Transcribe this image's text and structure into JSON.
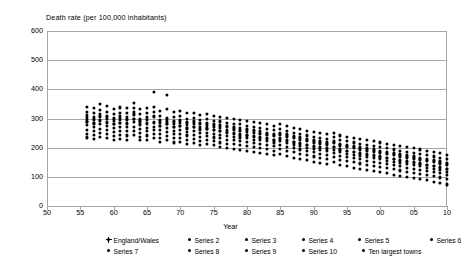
{
  "chart_data": {
    "type": "scatter",
    "title": "",
    "ylabel": "Death rate (per 100,000 inhabitants)",
    "xlabel": "Year",
    "ylim": [
      0,
      600
    ],
    "xlim": [
      50,
      110
    ],
    "grid": true,
    "legend_position": "bottom",
    "y_ticks": [
      "0",
      "100",
      "200",
      "300",
      "400",
      "500",
      "600"
    ],
    "y_tick_values": [
      0,
      100,
      200,
      300,
      400,
      500,
      600
    ],
    "x_ticks": [
      "50",
      "55",
      "60",
      "65",
      "70",
      "75",
      "80",
      "85",
      "90",
      "95",
      "00",
      "05",
      "10"
    ],
    "x_tick_values": [
      50,
      55,
      60,
      65,
      70,
      75,
      80,
      85,
      90,
      95,
      100,
      105,
      110
    ],
    "legend": [
      "England/Wales",
      "Series 2",
      "Series 3",
      "Series 4",
      "Series 5",
      "Series 6",
      "Series 7",
      "Series 8",
      "Series 9",
      "Series 10",
      "Ten largest towns"
    ],
    "series": [
      {
        "name": "England/Wales",
        "x": [
          56,
          57,
          58,
          59,
          60,
          61,
          62,
          63,
          64,
          65,
          66,
          67,
          68,
          69,
          70,
          71,
          72,
          73,
          74,
          75,
          76,
          77,
          78,
          79,
          80,
          81,
          82,
          83,
          84,
          85,
          86,
          87,
          88,
          89,
          90,
          91,
          92,
          93,
          94,
          95,
          96,
          97,
          98,
          99,
          100,
          101,
          102,
          103,
          104,
          105,
          106,
          107,
          108,
          109,
          110
        ],
        "values": [
          278,
          272,
          280,
          275,
          268,
          272,
          270,
          288,
          265,
          268,
          272,
          262,
          268,
          258,
          262,
          255,
          258,
          250,
          252,
          248,
          245,
          240,
          238,
          235,
          232,
          228,
          225,
          222,
          218,
          222,
          215,
          210,
          205,
          200,
          196,
          192,
          188,
          192,
          185,
          180,
          176,
          172,
          168,
          164,
          160,
          156,
          152,
          148,
          144,
          140,
          136,
          132,
          128,
          124,
          118
        ]
      },
      {
        "name": "Series 2",
        "x": [
          56,
          57,
          58,
          59,
          60,
          61,
          62,
          63,
          64,
          65,
          66,
          67,
          68,
          69,
          70,
          71,
          72,
          73,
          74,
          75,
          76,
          77,
          78,
          79,
          80,
          81,
          82,
          83,
          84,
          85,
          86,
          87,
          88,
          89,
          90,
          91,
          92,
          93,
          94,
          95,
          96,
          97,
          98,
          99,
          100,
          101,
          102,
          103,
          104,
          105,
          106,
          107,
          108,
          109,
          110
        ],
        "values": [
          300,
          295,
          305,
          298,
          292,
          296,
          294,
          312,
          290,
          295,
          390,
          285,
          290,
          282,
          285,
          278,
          280,
          272,
          275,
          270,
          268,
          262,
          260,
          258,
          255,
          250,
          248,
          245,
          240,
          245,
          238,
          232,
          228,
          222,
          218,
          214,
          210,
          215,
          206,
          202,
          198,
          194,
          190,
          186,
          182,
          178,
          174,
          170,
          166,
          162,
          158,
          154,
          150,
          146,
          140
        ]
      },
      {
        "name": "Series 3",
        "x": [
          56,
          57,
          58,
          59,
          60,
          61,
          62,
          63,
          64,
          65,
          66,
          67,
          68,
          69,
          70,
          71,
          72,
          73,
          74,
          75,
          76,
          77,
          78,
          79,
          80,
          81,
          82,
          83,
          84,
          85,
          86,
          87,
          88,
          89,
          90,
          91,
          92,
          93,
          94,
          95,
          96,
          97,
          98,
          99,
          100,
          101,
          102,
          103,
          104,
          105,
          106,
          107,
          108,
          109,
          110
        ],
        "values": [
          322,
          318,
          330,
          322,
          316,
          320,
          318,
          335,
          315,
          318,
          322,
          308,
          380,
          305,
          308,
          300,
          302,
          295,
          298,
          292,
          290,
          285,
          282,
          280,
          276,
          272,
          268,
          265,
          260,
          265,
          258,
          252,
          248,
          242,
          238,
          234,
          230,
          236,
          226,
          222,
          218,
          214,
          210,
          206,
          202,
          198,
          194,
          190,
          186,
          182,
          178,
          174,
          170,
          166,
          160
        ]
      },
      {
        "name": "Series 4",
        "x": [
          56,
          57,
          58,
          59,
          60,
          61,
          62,
          63,
          64,
          65,
          66,
          67,
          68,
          69,
          70,
          71,
          72,
          73,
          74,
          75,
          76,
          77,
          78,
          79,
          80,
          81,
          82,
          83,
          84,
          85,
          86,
          87,
          88,
          89,
          90,
          91,
          92,
          93,
          94,
          95,
          96,
          97,
          98,
          99,
          100,
          101,
          102,
          103,
          104,
          105,
          106,
          107,
          108,
          109,
          110
        ],
        "values": [
          340,
          335,
          350,
          342,
          334,
          338,
          336,
          352,
          332,
          336,
          340,
          326,
          332,
          322,
          326,
          318,
          320,
          312,
          315,
          310,
          306,
          302,
          298,
          296,
          292,
          288,
          284,
          280,
          276,
          280,
          274,
          268,
          264,
          258,
          254,
          250,
          246,
          252,
          242,
          238,
          234,
          230,
          226,
          222,
          218,
          214,
          210,
          206,
          202,
          198,
          194,
          190,
          186,
          182,
          176
        ]
      },
      {
        "name": "Series 5",
        "x": [
          56,
          57,
          58,
          59,
          60,
          61,
          62,
          63,
          64,
          65,
          66,
          67,
          68,
          69,
          70,
          71,
          72,
          73,
          74,
          75,
          76,
          77,
          78,
          79,
          80,
          81,
          82,
          83,
          84,
          85,
          86,
          87,
          88,
          89,
          90,
          91,
          92,
          93,
          94,
          95,
          96,
          97,
          98,
          99,
          100,
          101,
          102,
          103,
          104,
          105,
          106,
          107,
          108,
          109,
          110
        ],
        "values": [
          262,
          258,
          264,
          260,
          254,
          258,
          256,
          272,
          252,
          256,
          260,
          248,
          254,
          246,
          248,
          242,
          244,
          238,
          240,
          235,
          232,
          228,
          225,
          222,
          220,
          216,
          212,
          208,
          205,
          208,
          202,
          198,
          194,
          188,
          185,
          180,
          176,
          182,
          172,
          168,
          164,
          160,
          156,
          152,
          148,
          144,
          140,
          136,
          132,
          128,
          124,
          120,
          116,
          112,
          106
        ]
      },
      {
        "name": "Series 6",
        "x": [
          56,
          57,
          58,
          59,
          60,
          61,
          62,
          63,
          64,
          65,
          66,
          67,
          68,
          69,
          70,
          71,
          72,
          73,
          74,
          75,
          76,
          77,
          78,
          79,
          80,
          81,
          82,
          83,
          84,
          85,
          86,
          87,
          88,
          89,
          90,
          91,
          92,
          93,
          94,
          95,
          96,
          97,
          98,
          99,
          100,
          101,
          102,
          103,
          104,
          105,
          106,
          107,
          108,
          109,
          110
        ],
        "values": [
          248,
          244,
          250,
          246,
          240,
          244,
          242,
          258,
          238,
          242,
          246,
          234,
          240,
          232,
          234,
          228,
          230,
          224,
          226,
          222,
          218,
          214,
          212,
          208,
          206,
          202,
          198,
          195,
          190,
          195,
          188,
          184,
          180,
          175,
          170,
          166,
          162,
          168,
          158,
          154,
          150,
          146,
          142,
          138,
          134,
          130,
          126,
          122,
          118,
          114,
          110,
          106,
          102,
          98,
          92
        ]
      },
      {
        "name": "Series 7",
        "x": [
          56,
          57,
          58,
          59,
          60,
          61,
          62,
          63,
          64,
          65,
          66,
          67,
          68,
          69,
          70,
          71,
          72,
          73,
          74,
          75,
          76,
          77,
          78,
          79,
          80,
          81,
          82,
          83,
          84,
          85,
          86,
          87,
          88,
          89,
          90,
          91,
          92,
          93,
          94,
          95,
          96,
          97,
          98,
          99,
          100,
          101,
          102,
          103,
          104,
          105,
          106,
          107,
          108,
          109,
          110
        ],
        "values": [
          290,
          286,
          294,
          288,
          282,
          286,
          284,
          300,
          280,
          284,
          288,
          276,
          282,
          272,
          276,
          268,
          272,
          264,
          266,
          262,
          258,
          254,
          250,
          248,
          244,
          240,
          236,
          232,
          228,
          232,
          226,
          220,
          216,
          210,
          206,
          202,
          198,
          204,
          194,
          190,
          186,
          182,
          178,
          174,
          170,
          166,
          162,
          158,
          154,
          150,
          146,
          142,
          138,
          134,
          128
        ]
      },
      {
        "name": "Series 8",
        "x": [
          56,
          57,
          58,
          59,
          60,
          61,
          62,
          63,
          64,
          65,
          66,
          67,
          68,
          69,
          70,
          71,
          72,
          73,
          74,
          75,
          76,
          77,
          78,
          79,
          80,
          81,
          82,
          83,
          84,
          85,
          86,
          87,
          88,
          89,
          90,
          91,
          92,
          93,
          94,
          95,
          96,
          97,
          98,
          99,
          100,
          101,
          102,
          103,
          104,
          105,
          106,
          107,
          108,
          109,
          110
        ],
        "values": [
          312,
          306,
          316,
          310,
          302,
          308,
          305,
          322,
          300,
          305,
          308,
          296,
          302,
          292,
          296,
          288,
          292,
          284,
          286,
          282,
          278,
          274,
          270,
          268,
          264,
          260,
          256,
          252,
          248,
          252,
          246,
          240,
          236,
          230,
          226,
          222,
          218,
          224,
          214,
          210,
          206,
          202,
          198,
          194,
          190,
          186,
          182,
          178,
          174,
          170,
          166,
          162,
          158,
          154,
          148
        ]
      },
      {
        "name": "Series 9",
        "x": [
          56,
          57,
          58,
          59,
          60,
          61,
          62,
          63,
          64,
          65,
          66,
          67,
          68,
          69,
          70,
          71,
          72,
          73,
          74,
          75,
          76,
          77,
          78,
          79,
          80,
          81,
          82,
          83,
          84,
          85,
          86,
          87,
          88,
          89,
          90,
          91,
          92,
          93,
          94,
          95,
          96,
          97,
          98,
          99,
          100,
          101,
          102,
          103,
          104,
          105,
          106,
          107,
          108,
          109,
          110
        ],
        "values": [
          235,
          230,
          238,
          232,
          226,
          230,
          228,
          244,
          225,
          228,
          232,
          220,
          226,
          218,
          220,
          214,
          216,
          210,
          212,
          208,
          204,
          200,
          196,
          192,
          190,
          186,
          182,
          178,
          174,
          178,
          172,
          166,
          162,
          158,
          152,
          148,
          144,
          150,
          140,
          136,
          132,
          128,
          124,
          120,
          116,
          112,
          108,
          104,
          100,
          96,
          92,
          88,
          84,
          80,
          74
        ]
      },
      {
        "name": "Series 10",
        "x": [
          56,
          57,
          58,
          59,
          60,
          61,
          62,
          63,
          64,
          65,
          66,
          67,
          68,
          69,
          70,
          71,
          72,
          73,
          74,
          75,
          76,
          77,
          78,
          79,
          80,
          81,
          82,
          83,
          84,
          85,
          86,
          87,
          88,
          89,
          90,
          91,
          92,
          93,
          94,
          95,
          96,
          97,
          98,
          99,
          100,
          101,
          102,
          103,
          104,
          105,
          106,
          107,
          108,
          109,
          110
        ],
        "values": [
          288,
          283,
          292,
          286,
          280,
          284,
          282,
          298,
          278,
          282,
          285,
          274,
          280,
          270,
          274,
          266,
          270,
          262,
          264,
          260,
          256,
          252,
          248,
          245,
          242,
          238,
          234,
          230,
          226,
          230,
          224,
          218,
          214,
          208,
          204,
          200,
          196,
          202,
          192,
          188,
          184,
          180,
          176,
          172,
          168,
          164,
          160,
          156,
          152,
          148,
          144,
          140,
          136,
          132,
          126
        ]
      },
      {
        "name": "Ten largest towns",
        "x": [
          56,
          57,
          58,
          59,
          60,
          61,
          62,
          63,
          64,
          65,
          66,
          67,
          68,
          69,
          70,
          71,
          72,
          73,
          74,
          75,
          76,
          77,
          78,
          79,
          80,
          81,
          82,
          83,
          84,
          85,
          86,
          87,
          88,
          89,
          90,
          91,
          92,
          93,
          94,
          95,
          96,
          97,
          98,
          99,
          100,
          101,
          102,
          103,
          104,
          105,
          106,
          107,
          108,
          109,
          110
        ],
        "values": [
          306,
          300,
          310,
          304,
          298,
          302,
          300,
          316,
          296,
          300,
          304,
          292,
          298,
          288,
          292,
          284,
          288,
          280,
          282,
          278,
          274,
          270,
          266,
          262,
          260,
          256,
          252,
          248,
          244,
          248,
          242,
          236,
          232,
          226,
          222,
          218,
          214,
          220,
          210,
          206,
          202,
          198,
          194,
          190,
          186,
          182,
          178,
          174,
          170,
          166,
          162,
          158,
          154,
          150,
          144
        ]
      }
    ]
  },
  "caption": ""
}
